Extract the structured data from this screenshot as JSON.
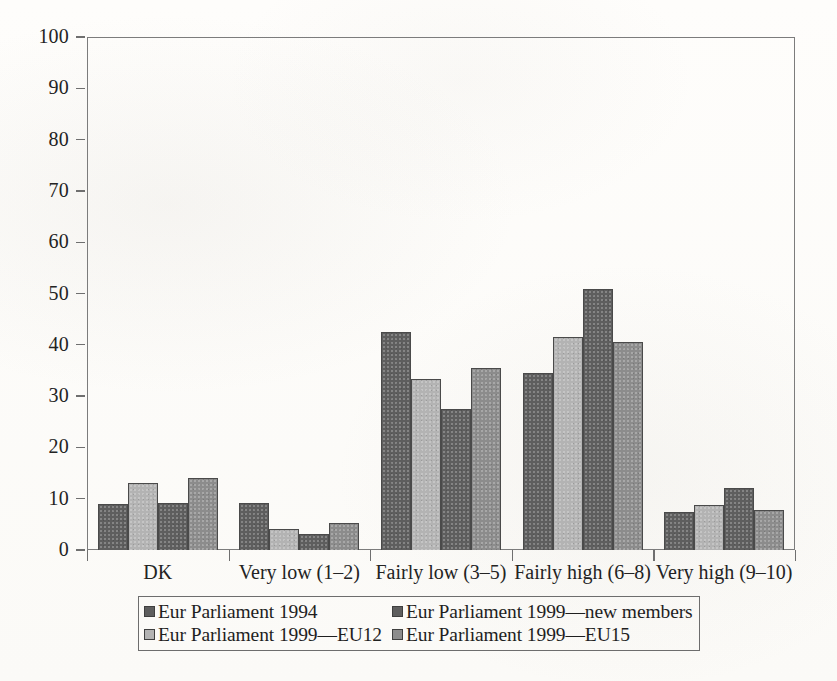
{
  "chart_data": {
    "type": "bar",
    "title": "",
    "subtitle": "",
    "xlabel": "",
    "ylabel": "",
    "ylim": [
      0,
      100
    ],
    "yticks": [
      0,
      10,
      20,
      30,
      40,
      50,
      60,
      70,
      80,
      90,
      100
    ],
    "grid": false,
    "legend_position": "bottom",
    "categories": [
      "DK",
      "Very low (1–2)",
      "Fairly low (3–5)",
      "Fairly high (6–8)",
      "Very high (9–10)"
    ],
    "series": [
      {
        "name": "Eur Parliament 1994",
        "color": "#5e5e5e",
        "values": [
          9.0,
          9.2,
          42.5,
          34.5,
          7.5
        ]
      },
      {
        "name": "Eur Parliament 1999—EU12",
        "color": "#b3b3b3",
        "values": [
          13.0,
          4.1,
          33.3,
          41.6,
          8.7
        ]
      },
      {
        "name": "Eur Parliament 1999—new members",
        "color": "#5e5e5e",
        "values": [
          9.1,
          3.1,
          27.5,
          50.8,
          12.0
        ]
      },
      {
        "name": "Eur Parliament 1999—EU15",
        "color": "#8c8c8c",
        "values": [
          14.1,
          5.2,
          35.5,
          40.5,
          7.8
        ]
      }
    ]
  },
  "legend": {
    "entries": [
      {
        "label": "Eur Parliament 1994",
        "color": "#5e5e5e"
      },
      {
        "label": "Eur Parliament 1999—new members",
        "color": "#5e5e5e"
      },
      {
        "label": "Eur Parliament 1999—EU12",
        "color": "#b3b3b3"
      },
      {
        "label": "Eur Parliament 1999—EU15",
        "color": "#8c8c8c"
      }
    ]
  },
  "axis": {
    "y_tick_labels": [
      "0",
      "10",
      "20",
      "30",
      "40",
      "50",
      "60",
      "70",
      "80",
      "90",
      "100"
    ]
  }
}
